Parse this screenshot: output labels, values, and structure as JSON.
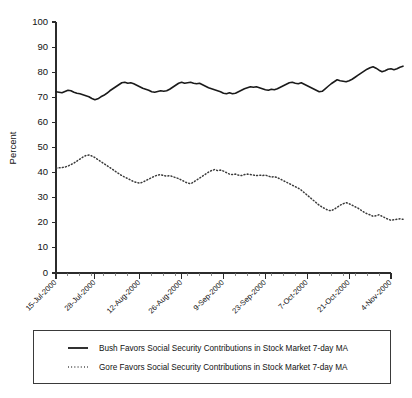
{
  "chart_data": {
    "type": "line",
    "title": "",
    "xlabel": "",
    "ylabel": "Percent",
    "ylim": [
      0,
      100
    ],
    "ytick_values": [
      0,
      10,
      20,
      30,
      40,
      50,
      60,
      70,
      80,
      90,
      100
    ],
    "grid": false,
    "legend_position": "bottom",
    "x_tick_labels": [
      "15-Jul-2000",
      "28-Jul-2000",
      "12-Aug-2000",
      "26-Aug-2000",
      "9-Sep-2000",
      "23-Sep-2000",
      "7-Oct-2000",
      "21-Oct-2000",
      "4-Nov-2000"
    ],
    "x_index_of_ticks": [
      0,
      13,
      28,
      42,
      56,
      70,
      84,
      98,
      112
    ],
    "x_count": 113,
    "series": [
      {
        "name": "Bush Favors Social Security Contributions in Stock Market 7-day MA",
        "style": "solid",
        "color": "#1a1a1a",
        "values": [
          72.2,
          72.0,
          71.8,
          72.3,
          72.8,
          72.6,
          72.0,
          71.6,
          71.4,
          71.0,
          70.6,
          70.2,
          69.5,
          69.0,
          69.4,
          70.2,
          70.8,
          71.6,
          72.6,
          73.4,
          74.2,
          75.0,
          75.8,
          76.0,
          75.6,
          75.8,
          75.4,
          74.8,
          74.2,
          73.6,
          73.2,
          72.8,
          72.2,
          72.0,
          72.3,
          72.6,
          72.4,
          72.6,
          73.2,
          74.0,
          74.8,
          75.6,
          76.0,
          75.6,
          75.8,
          76.0,
          75.6,
          75.4,
          75.6,
          75.0,
          74.4,
          73.8,
          73.4,
          73.0,
          72.6,
          72.2,
          71.6,
          71.4,
          71.8,
          71.4,
          71.6,
          72.2,
          72.8,
          73.4,
          73.8,
          74.2,
          74.0,
          74.2,
          73.8,
          73.4,
          73.0,
          72.8,
          73.2,
          73.0,
          73.4,
          74.0,
          74.6,
          75.2,
          75.8,
          76.0,
          75.6,
          75.4,
          75.8,
          75.2,
          74.6,
          74.0,
          73.4,
          72.8,
          72.2,
          72.4,
          73.4,
          74.4,
          75.4,
          76.2,
          77.0,
          76.6,
          76.4,
          76.2,
          76.6,
          77.2,
          78.0,
          78.8,
          79.6,
          80.4,
          81.2,
          81.8,
          82.2,
          81.6,
          80.8,
          80.2,
          80.6,
          81.2,
          81.4,
          81.0,
          81.4,
          82.0,
          82.4
        ]
      },
      {
        "name": "Gore Favors Social Security Contributions in Stock Market 7-day MA",
        "style": "dotted",
        "color": "#3a3a3a",
        "values": [
          41.8,
          41.9,
          42.0,
          42.2,
          42.6,
          43.2,
          43.8,
          44.6,
          45.4,
          46.2,
          46.8,
          47.0,
          46.6,
          46.0,
          45.2,
          44.4,
          43.6,
          42.8,
          42.0,
          41.2,
          40.4,
          39.6,
          38.8,
          38.2,
          37.6,
          37.0,
          36.4,
          36.0,
          35.8,
          36.2,
          36.8,
          37.4,
          38.0,
          38.6,
          39.0,
          39.2,
          38.8,
          38.6,
          38.8,
          38.4,
          38.0,
          37.6,
          37.0,
          36.4,
          35.8,
          35.6,
          36.2,
          37.0,
          37.8,
          38.6,
          39.4,
          40.2,
          40.8,
          41.2,
          40.8,
          41.0,
          40.6,
          40.0,
          39.4,
          39.2,
          39.4,
          39.0,
          38.8,
          39.2,
          39.4,
          39.2,
          39.0,
          38.8,
          39.0,
          38.8,
          39.0,
          38.6,
          38.2,
          38.4,
          38.0,
          37.4,
          36.8,
          36.2,
          35.6,
          35.0,
          34.4,
          33.8,
          33.0,
          32.0,
          31.0,
          30.0,
          29.0,
          28.0,
          27.0,
          26.2,
          25.6,
          25.0,
          24.8,
          25.4,
          26.2,
          27.0,
          27.6,
          28.0,
          27.6,
          27.0,
          26.4,
          25.8,
          25.0,
          24.2,
          23.6,
          23.2,
          22.6,
          22.8,
          23.2,
          22.6,
          22.0,
          21.4,
          21.0,
          21.2,
          21.4,
          21.6,
          21.4
        ]
      }
    ]
  },
  "axis": {
    "y_title": "Percent"
  },
  "legend": {
    "entries": [
      {
        "label": "Bush Favors Social Security Contributions in Stock Market 7-day MA",
        "sample": "solid-line-sample"
      },
      {
        "label": "Gore Favors Social Security Contributions in Stock Market 7-day MA",
        "sample": "dotted-line-sample"
      }
    ]
  },
  "colors": {
    "bush_line": "#1a1a1a",
    "gore_line": "#3a3a3a",
    "axis": "#2b2b2b",
    "background": "#ffffff"
  }
}
